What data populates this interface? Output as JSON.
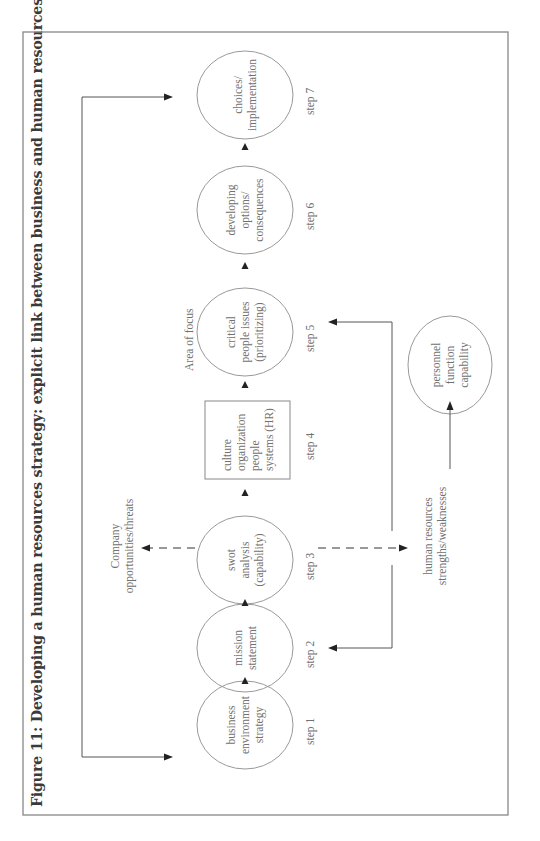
{
  "figure": {
    "title": "Figure 11: Developing a human resources strategy: explicit link between business and human resources strategy"
  },
  "steps": [
    {
      "step_label": "step 1",
      "text": "business environment strategy",
      "lines": [
        "business",
        "environment",
        "strategy"
      ],
      "shape": "circle"
    },
    {
      "step_label": "step 2",
      "text": "mission statement",
      "lines": [
        "mission",
        "statement"
      ],
      "shape": "circle"
    },
    {
      "step_label": "step 3",
      "text": "swot analysis (capability)",
      "lines": [
        "swot",
        "analysis",
        "(capability)"
      ],
      "shape": "circle"
    },
    {
      "step_label": "step 4",
      "text": "culture organization people systems (HR)",
      "lines": [
        "culture",
        "organization",
        "people",
        "systems (HR)"
      ],
      "shape": "box"
    },
    {
      "step_label": "step 5",
      "text": "critical people issues (prioritizing)",
      "lines": [
        "critical",
        "people issues",
        "(prioritizing)"
      ],
      "shape": "circle"
    },
    {
      "step_label": "step 6",
      "text": "developing options/ consequences",
      "lines": [
        "developing",
        "options/",
        "consequences"
      ],
      "shape": "circle"
    },
    {
      "step_label": "step 7",
      "text": "choices/ implementation",
      "lines": [
        "choices/",
        "implementation"
      ],
      "shape": "circle"
    }
  ],
  "annotations": {
    "company": [
      "Company",
      "opportunities/threats"
    ],
    "area_of_focus": "Area of focus",
    "hr": [
      "human resources",
      "strengths/weaknesses"
    ]
  },
  "personnel": {
    "text": "personnel function capability",
    "lines": [
      "personnel",
      "function",
      "capability"
    ]
  },
  "connections": [
    {
      "from": "step 1",
      "to": "step 2",
      "style": "solid"
    },
    {
      "from": "step 2",
      "to": "step 3",
      "style": "solid"
    },
    {
      "from": "step 3",
      "to": "step 4",
      "style": "solid"
    },
    {
      "from": "step 4",
      "to": "step 5",
      "style": "solid"
    },
    {
      "from": "step 5",
      "to": "step 6",
      "style": "solid"
    },
    {
      "from": "step 6",
      "to": "step 7",
      "style": "solid"
    },
    {
      "from": "step 3",
      "to": "Company opportunities/threats",
      "style": "dashed"
    },
    {
      "from": "step 3",
      "to": "human resources strengths/weaknesses",
      "style": "dashed"
    },
    {
      "from": "human resources strengths/weaknesses",
      "to": "personnel function capability",
      "style": "solid"
    },
    {
      "from": "feedback",
      "to": "step 1",
      "style": "solid"
    },
    {
      "from": "feedback",
      "to": "step 7",
      "style": "solid"
    },
    {
      "from": "feedback",
      "to": "step 2",
      "style": "solid"
    },
    {
      "from": "feedback",
      "to": "step 5",
      "style": "solid"
    }
  ]
}
